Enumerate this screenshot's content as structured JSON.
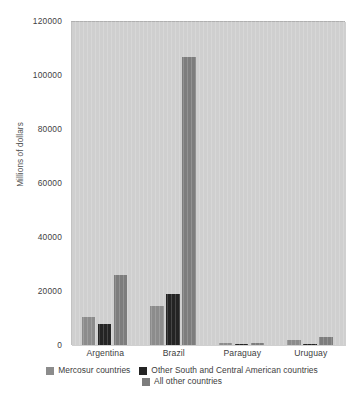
{
  "chart_data": {
    "type": "bar",
    "title": "",
    "subtitle": "",
    "xlabel": "",
    "ylabel": "Millions of dollars",
    "categories": [
      "Argentina",
      "Brazil",
      "Paraguay",
      "Uruguay"
    ],
    "series": [
      {
        "name": "Mercosur countries",
        "color": "#8c8c8c",
        "values": [
          10500,
          14500,
          600,
          1900
        ]
      },
      {
        "name": "Other South and Central American countries",
        "color": "#242424",
        "values": [
          7800,
          18800,
          150,
          350
        ]
      },
      {
        "name": "All other countries",
        "color": "#7d7d7d",
        "values": [
          25800,
          106500,
          900,
          3100
        ]
      }
    ],
    "ylim": [
      0,
      120000
    ],
    "y_ticks": [
      0,
      20000,
      40000,
      60000,
      80000,
      100000,
      120000
    ],
    "y_tick_labels": [
      "0",
      "20000",
      "40000",
      "60000",
      "80000",
      "100000",
      "120000"
    ],
    "grid": false,
    "legend_position": "bottom",
    "plot_background": "#cfcfcf",
    "annotations": []
  },
  "legend": {
    "items": [
      {
        "label": "Mercosur countries",
        "swatch_name": "legend-swatch-mercosur-countries"
      },
      {
        "label": "Other South and Central American countries",
        "swatch_name": "legend-swatch-other-south-central-american"
      },
      {
        "label": "All other countries",
        "swatch_name": "legend-swatch-all-other-countries"
      }
    ]
  }
}
